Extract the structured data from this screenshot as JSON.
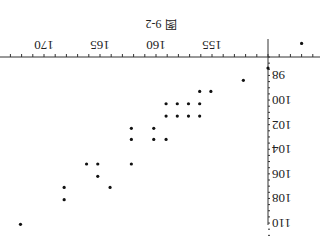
{
  "chart_data": {
    "type": "scatter",
    "title": "图 9-2",
    "xlabel": "",
    "ylabel": "",
    "rotated_180": true,
    "x_ticks": [
      155,
      160,
      165,
      170
    ],
    "y_ticks": [
      98,
      100,
      102,
      104,
      106,
      108,
      110
    ],
    "axis_origin": {
      "x": 150,
      "y": 96.5
    },
    "xlim": [
      146,
      173
    ],
    "ylim": [
      95,
      111
    ],
    "grid": false,
    "points": [
      {
        "x": 147,
        "y": 95.4
      },
      {
        "x": 150,
        "y": 97.4
      },
      {
        "x": 152.2,
        "y": 98.4
      },
      {
        "x": 155.1,
        "y": 99.3
      },
      {
        "x": 156.1,
        "y": 99.3
      },
      {
        "x": 156.1,
        "y": 100.3
      },
      {
        "x": 157.1,
        "y": 100.3
      },
      {
        "x": 158.1,
        "y": 100.3
      },
      {
        "x": 159.1,
        "y": 100.3
      },
      {
        "x": 156.1,
        "y": 101.3
      },
      {
        "x": 157.1,
        "y": 101.3
      },
      {
        "x": 158.1,
        "y": 101.3
      },
      {
        "x": 159.1,
        "y": 101.3
      },
      {
        "x": 160.2,
        "y": 102.3
      },
      {
        "x": 162.2,
        "y": 102.3
      },
      {
        "x": 159.1,
        "y": 103.2
      },
      {
        "x": 160.2,
        "y": 103.2
      },
      {
        "x": 162.2,
        "y": 103.2
      },
      {
        "x": 162.2,
        "y": 105.2
      },
      {
        "x": 165.2,
        "y": 105.2
      },
      {
        "x": 166.2,
        "y": 105.2
      },
      {
        "x": 165.2,
        "y": 106.2
      },
      {
        "x": 164.1,
        "y": 107.1
      },
      {
        "x": 168.2,
        "y": 107.1
      },
      {
        "x": 168.2,
        "y": 108.1
      },
      {
        "x": 172.1,
        "y": 110.1
      }
    ]
  }
}
